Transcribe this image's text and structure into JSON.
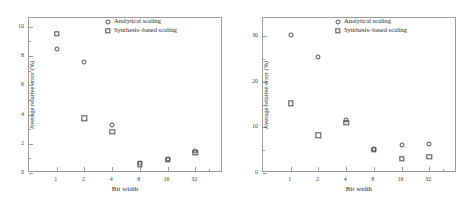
{
  "figure": {
    "panels": [
      "left",
      "right"
    ]
  },
  "legend": {
    "analytical": "Analytical scaling",
    "synthesis": "Synthesis–based scaling",
    "analytical_symbol": "circle-marker-icon",
    "synthesis_symbol": "square-marker-icon"
  },
  "chart_data": [
    {
      "type": "scatter",
      "panel": "left",
      "title": "",
      "xlabel": "Bit width",
      "ylabel": "Average relative error (%)",
      "x_categories": [
        "1",
        "2",
        "4",
        "8",
        "16",
        "32"
      ],
      "xtick_labels": [
        "1",
        "2",
        "4",
        "8",
        "16",
        "32"
      ],
      "ytick_labels": [
        "0",
        "2",
        "4",
        "6",
        "8",
        "10"
      ],
      "ytick_values": [
        0,
        2,
        4,
        6,
        8,
        10
      ],
      "ylim": [
        0,
        10.6
      ],
      "grid": false,
      "legend_position": "top-right-inside",
      "series": [
        {
          "name": "Analytical scaling",
          "marker": "circle",
          "values": [
            8.5,
            7.6,
            3.25,
            0.65,
            0.95,
            1.5
          ]
        },
        {
          "name": "Synthesis–based scaling",
          "marker": "square",
          "values": [
            9.5,
            3.75,
            2.8,
            0.6,
            0.9,
            1.4
          ]
        }
      ]
    },
    {
      "type": "scatter",
      "panel": "right",
      "title": "",
      "xlabel": "Bit width",
      "ylabel": "Average relative error (%)",
      "x_categories": [
        "1",
        "2",
        "4",
        "8",
        "16",
        "32"
      ],
      "xtick_labels": [
        "1",
        "2",
        "4",
        "8",
        "16",
        "32"
      ],
      "ytick_labels": [
        "0",
        "10",
        "20",
        "30"
      ],
      "ytick_values": [
        0,
        10,
        20,
        30
      ],
      "ylim": [
        0,
        34
      ],
      "grid": false,
      "legend_position": "top-right-inside",
      "series": [
        {
          "name": "Analytical scaling",
          "marker": "circle",
          "values": [
            30.3,
            25.5,
            11.6,
            5.2,
            6.2,
            6.4
          ]
        },
        {
          "name": "Synthesis–based scaling",
          "marker": "square",
          "values": [
            15.3,
            8.3,
            11.0,
            5.1,
            3.1,
            3.6
          ]
        }
      ]
    }
  ]
}
